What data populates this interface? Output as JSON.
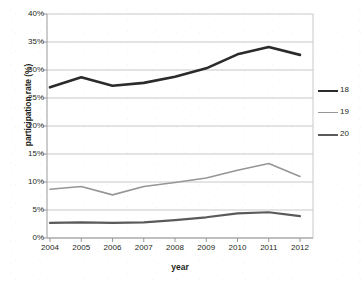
{
  "chart_data": {
    "type": "line",
    "title": "",
    "subtitle": "",
    "xlabel": "year",
    "ylabel": "participation rate (%)",
    "categories": [
      "2004",
      "2005",
      "2006",
      "2007",
      "2008",
      "2009",
      "2010",
      "2011",
      "2012"
    ],
    "x": [
      2004,
      2005,
      2006,
      2007,
      2008,
      2009,
      2010,
      2011,
      2012
    ],
    "xlim": [
      2004,
      2012
    ],
    "ylim": [
      0,
      40
    ],
    "ytick_labels": [
      "0%",
      "5%",
      "10%",
      "15%",
      "20%",
      "25%",
      "30%",
      "35%",
      "40%"
    ],
    "ytick_values": [
      0,
      5,
      10,
      15,
      20,
      25,
      30,
      35,
      40
    ],
    "grid": "horizontal",
    "legend_position": "right",
    "series": [
      {
        "name": "18",
        "color": "#2b2b2b",
        "width": 2.6,
        "values": [
          26.9,
          28.7,
          27.2,
          27.7,
          28.8,
          30.3,
          32.8,
          34.1,
          32.7
        ]
      },
      {
        "name": "19",
        "color": "#969696",
        "width": 1.6,
        "values": [
          8.7,
          9.2,
          7.7,
          9.2,
          9.9,
          10.7,
          12.1,
          13.3,
          11.0
        ]
      },
      {
        "name": "20",
        "color": "#5a5a5a",
        "width": 2.2,
        "values": [
          2.7,
          2.8,
          2.7,
          2.8,
          3.2,
          3.7,
          4.4,
          4.6,
          3.9
        ]
      }
    ]
  },
  "axes": {
    "y_title": "participation rate (%)",
    "x_title": "year"
  },
  "legend": {
    "entries": [
      {
        "label": "18"
      },
      {
        "label": "19"
      },
      {
        "label": "20"
      }
    ]
  },
  "colors": {
    "series_18": "#2b2b2b",
    "series_19": "#969696",
    "series_20": "#5a5a5a",
    "gridline": "#c9c9c9",
    "axis": "#9a9a9a",
    "text": "#231f20",
    "background": "#ffffff"
  }
}
